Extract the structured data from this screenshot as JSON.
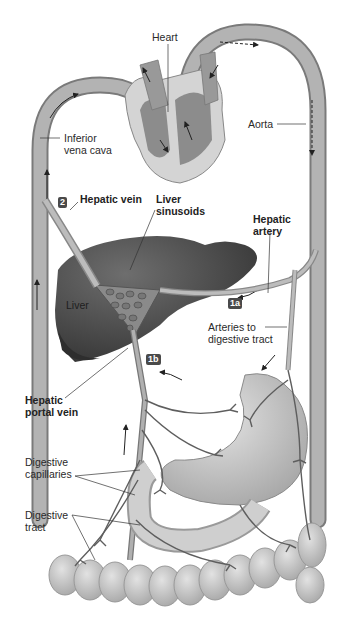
{
  "diagram": {
    "title_context": "Hepatic portal circulation",
    "colors": {
      "vessel_fill": "#a9a9a9",
      "vessel_edge": "#7a7a7a",
      "heart_chamber": "#8c8c8c",
      "heart_wall": "#d4d4d4",
      "liver": "#5a5a5a",
      "liver_dark": "#3f3f3f",
      "gut": "#c8c8c8",
      "capillary": "#5e5e5e",
      "badge_bg": "#4a4a4a",
      "text": "#2a2a2a"
    },
    "labels": {
      "heart": "Heart",
      "aorta": "Aorta",
      "inferior_vena_cava": "Inferior\nvena cava",
      "hepatic_vein": "Hepatic vein",
      "liver_sinusoids": "Liver\nsinusoids",
      "hepatic_artery": "Hepatic\nartery",
      "liver": "Liver",
      "arteries_to_digestive_tract": "Arteries to\ndigestive tract",
      "hepatic_portal_vein": "Hepatic\nportal vein",
      "digestive_capillaries": "Digestive\ncapillaries",
      "digestive_tract": "Digestive\ntract"
    },
    "badges": {
      "step_2": "2",
      "step_1a": "1a",
      "step_1b": "1b"
    }
  }
}
